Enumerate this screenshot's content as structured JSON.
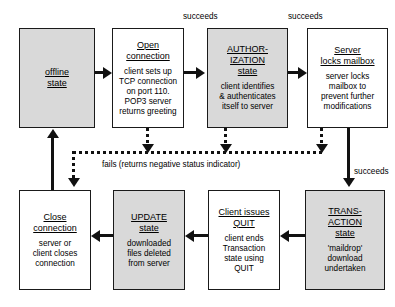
{
  "diagram": {
    "boxes": [
      {
        "id": "offline",
        "name": "offline-state",
        "title": "offline\nstate",
        "body": "",
        "shaded": true,
        "x": 19,
        "y": 28,
        "w": 76,
        "h": 100
      },
      {
        "id": "open",
        "name": "open-connection-state",
        "title": "Open\nconnection",
        "body": "client sets up\nTCP connection\non port 110.\nPOP3 server\nreturns greeting",
        "shaded": false,
        "x": 112,
        "y": 28,
        "w": 72,
        "h": 100
      },
      {
        "id": "authorization",
        "name": "authorization-state",
        "title": "AUTHOR-\nIZATION\nstate",
        "body": "client identifies\n& authenticates\nitself to server",
        "shaded": true,
        "x": 207,
        "y": 28,
        "w": 81,
        "h": 100
      },
      {
        "id": "serverlocks",
        "name": "server-locks-mailbox-state",
        "title": "Server\nlocks mailbox",
        "body": "server locks\nmailbox to\nprevent further\nmodifications",
        "shaded": false,
        "x": 307,
        "y": 28,
        "w": 81,
        "h": 100
      },
      {
        "id": "close",
        "name": "close-connection-state",
        "title": "Close\nconnection",
        "body": "server or\nclient closes\nconnection",
        "shaded": false,
        "x": 19,
        "y": 190,
        "w": 72,
        "h": 100
      },
      {
        "id": "update",
        "name": "update-state",
        "title": "UPDATE\nstate",
        "body": "downloaded\nfiles deleted\nfrom server",
        "shaded": true,
        "x": 113,
        "y": 190,
        "w": 72,
        "h": 100
      },
      {
        "id": "quit",
        "name": "client-issues-quit-state",
        "title": "Client issues\nQUIT",
        "body": "client ends\nTransaction\nstate using\nQUIT",
        "shaded": false,
        "x": 208,
        "y": 190,
        "w": 72,
        "h": 100
      },
      {
        "id": "transaction",
        "name": "transaction-state",
        "title": "TRANS-\nACTION\nstate",
        "body": "'maildrop'\ndownload\nundertaken",
        "shaded": true,
        "x": 305,
        "y": 190,
        "w": 80,
        "h": 100
      }
    ],
    "labels": [
      {
        "id": "succeeds1",
        "name": "succeeds-label-open-to-auth",
        "text": "succeeds",
        "x": 183,
        "y": 12
      },
      {
        "id": "succeeds2",
        "name": "succeeds-label-auth-to-server",
        "text": "succeeds",
        "x": 288,
        "y": 12
      },
      {
        "id": "fails",
        "name": "fails-label",
        "text": "fails (returns negative status indicator)",
        "x": 102,
        "y": 160
      },
      {
        "id": "succeeds3",
        "name": "succeeds-label-server-to-transaction",
        "text": "succeeds",
        "x": 354,
        "y": 167
      }
    ],
    "colors": {
      "shaded_fill": "#d9d9d9",
      "plain_fill": "#ffffff",
      "stroke": "#111111",
      "text": "#000000"
    }
  }
}
